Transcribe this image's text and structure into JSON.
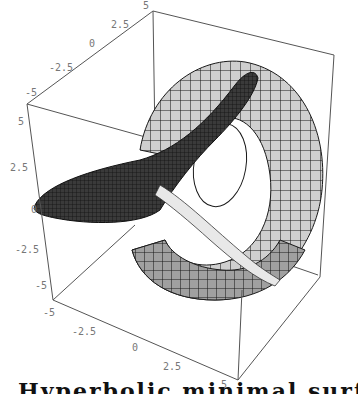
{
  "figure": {
    "type": "3d-surface-plot",
    "colors": {
      "box": "#555555",
      "surface_light": "#c8c8c8",
      "surface_mid": "#9a9a9a",
      "surface_dark": "#2a2a2a",
      "mesh": "#1a1a1a",
      "tick_label": "#777777"
    }
  },
  "axes": {
    "top_axis": {
      "ticks": [
        "-5",
        "-2.5",
        "0",
        "2.5",
        "5"
      ]
    },
    "left_axis": {
      "ticks": [
        "5",
        "2.5",
        "0",
        "-2.5",
        "-5"
      ]
    },
    "bottom_axis": {
      "ticks": [
        "-5",
        "-2.5",
        "0",
        "2.5",
        "5"
      ]
    }
  },
  "caption": {
    "text": "Hyperbolic minimal surface"
  }
}
